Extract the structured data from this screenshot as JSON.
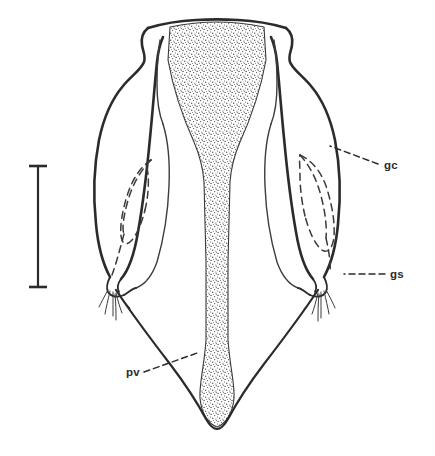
{
  "figure": {
    "domain": "scientific-line-drawing",
    "background_color": "#ffffff",
    "ink_color": "#2b2b2b",
    "stipple_color": "#555555",
    "width": 435,
    "height": 456
  },
  "labels": [
    {
      "id": "gc",
      "text": "gc",
      "meaning": "gonocoxite",
      "text_x": 384,
      "text_y": 169,
      "leader": {
        "style": "dashed",
        "x1": 378,
        "y1": 164,
        "x2": 330,
        "y2": 146
      }
    },
    {
      "id": "gs",
      "text": "gs",
      "meaning": "gonostylus",
      "text_x": 390,
      "text_y": 278,
      "leader": {
        "style": "dashed",
        "x1": 385,
        "y1": 274,
        "x2": 344,
        "y2": 274
      }
    },
    {
      "id": "pv",
      "text": "pv",
      "meaning": "ventral process",
      "text_x": 126,
      "text_y": 376,
      "leader": {
        "style": "dashed",
        "x1": 144,
        "y1": 372,
        "x2": 200,
        "y2": 352
      }
    }
  ],
  "scale_bar": {
    "name": "scale-bar",
    "orientation": "vertical",
    "x": 38,
    "y_top": 165,
    "y_bottom": 288,
    "cap_half_width": 9,
    "label": ""
  },
  "structures": [
    {
      "name": "central-sclerite",
      "texture": "stipple",
      "description": "central stippled aedeagal plate tapering downward"
    },
    {
      "name": "left-gonocoxite",
      "texture": "outline",
      "description": "left lateral lobe with dashed internal outline"
    },
    {
      "name": "right-gonocoxite",
      "texture": "outline",
      "description": "right lateral lobe with dashed internal outline"
    },
    {
      "name": "left-gonostylus",
      "texture": "outline",
      "description": "left apical process bearing setae"
    },
    {
      "name": "right-gonostylus",
      "texture": "outline",
      "description": "right apical process bearing setae"
    },
    {
      "name": "ventral-process",
      "texture": "outline",
      "description": "paired slender ventral arms meeting apically"
    }
  ]
}
